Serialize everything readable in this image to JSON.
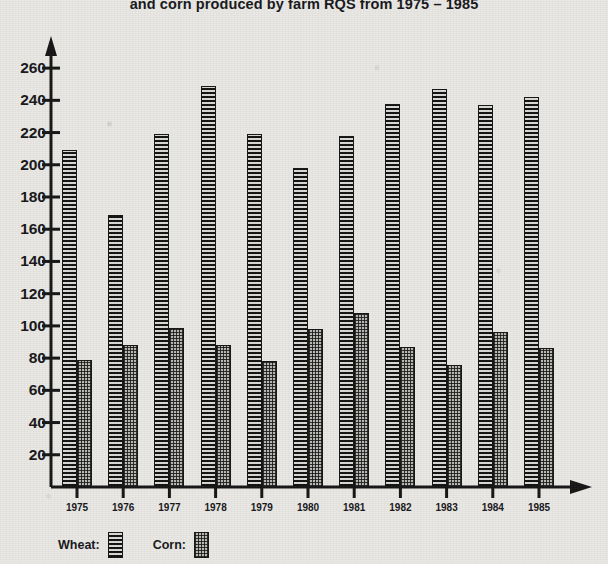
{
  "title": "and corn produced by farm RQS from 1975 – 1985",
  "legend": {
    "wheat_label": "Wheat:",
    "corn_label": "Corn:"
  },
  "colors": {
    "background": "#e9e8e4",
    "ink": "#141414",
    "wheat_fill": "#4a4a4a",
    "corn_fill": "#b9b9b4"
  },
  "chart_data": {
    "type": "bar",
    "title": "and corn produced by farm RQS from 1975 – 1985",
    "xlabel": "",
    "ylabel": "",
    "categories": [
      "1975",
      "1976",
      "1977",
      "1978",
      "1979",
      "1980",
      "1981",
      "1982",
      "1983",
      "1984",
      "1985"
    ],
    "series": [
      {
        "name": "Wheat",
        "values": [
          209,
          169,
          219,
          249,
          219,
          198,
          218,
          238,
          247,
          237,
          242
        ]
      },
      {
        "name": "Corn",
        "values": [
          79,
          88,
          99,
          88,
          78,
          98,
          108,
          87,
          76,
          96,
          86
        ]
      }
    ],
    "ylim": [
      0,
      270
    ],
    "yticks": [
      20,
      40,
      60,
      80,
      100,
      120,
      140,
      160,
      180,
      200,
      220,
      240,
      260
    ],
    "ytick_labels": [
      "20",
      "40",
      "60",
      "80",
      "100",
      "120",
      "140",
      "160",
      "180",
      "200",
      "220",
      "240",
      "260"
    ],
    "grid": false,
    "legend_position": "bottom-left",
    "axis_style": "arrow-ended axes, no gridlines"
  }
}
